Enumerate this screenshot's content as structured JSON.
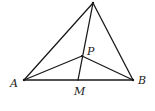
{
  "diagram": {
    "type": "geometry",
    "points": {
      "C": {
        "x": 93,
        "y": 3,
        "label": ""
      },
      "A": {
        "x": 24,
        "y": 80,
        "label": "A"
      },
      "B": {
        "x": 133,
        "y": 80,
        "label": "B"
      },
      "P": {
        "x": 82,
        "y": 56,
        "label": "P"
      },
      "M": {
        "x": 78,
        "y": 80,
        "label": "M"
      }
    },
    "labels": {
      "A": "A",
      "B": "B",
      "P": "P",
      "M": "M"
    },
    "segments": [
      [
        "C",
        "A"
      ],
      [
        "C",
        "B"
      ],
      [
        "A",
        "B"
      ],
      [
        "C",
        "M"
      ],
      [
        "P",
        "A"
      ],
      [
        "P",
        "B"
      ]
    ],
    "stroke_color": "#1a1a1a"
  }
}
